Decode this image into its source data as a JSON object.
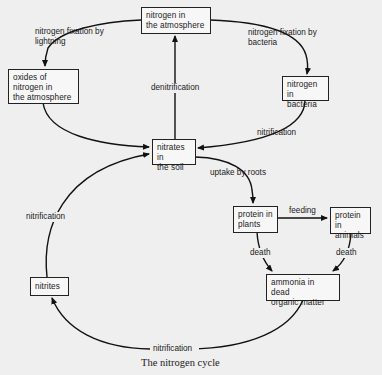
{
  "diagram": {
    "caption": "The nitrogen cycle",
    "nodes": {
      "nitrogen_atmosphere": "nitrogen in\nthe atmosphere",
      "oxides_nitrogen": "oxides of\nnitrogen in\nthe atmosphere",
      "nitrogen_bacteria": "nitrogen in\nbacteria",
      "nitrates_soil": "nitrates in\nthe soil",
      "protein_plants": "protein in\nplants",
      "protein_animals": "protein in\nanimals",
      "ammonia": "ammonia in dead\norganic matter",
      "nitrites": "nitrites"
    },
    "edges": {
      "fixation_lightning": "nitrogen fixation by\nlightning",
      "fixation_bacteria": "nitrogen fixation by\nbacteria",
      "denitrification": "denitrification",
      "nitrification_bacteria": "nitrification",
      "uptake_roots": "uptake by roots",
      "feeding": "feeding",
      "death_plants": "death",
      "death_animals": "death",
      "nitrification_bottom": "nitrification",
      "nitrification_left": "nitrification"
    }
  }
}
